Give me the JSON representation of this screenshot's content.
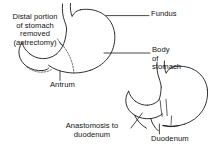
{
  "figure": {
    "background_color": "#ffffff",
    "line_color": "#1a1a1a",
    "text_color": "#111111",
    "width": 223,
    "height": 152
  },
  "labels": {
    "distal_portion": "Distal portion\nof stomach\nremoved\n(antrectomy)",
    "fundus": "Fundus",
    "body_of_stomach": "Body\nof\nstomach",
    "antrum": "Antrum",
    "anastomosis": "Anastomosis to\nduodenum",
    "duodenum": "Duodenum"
  },
  "structures": {
    "upper_figure": {
      "name": "pre-operative stomach with resection margin",
      "parts": [
        "esophagus",
        "fundus",
        "body",
        "antrum",
        "duodenum",
        "resection-line"
      ]
    },
    "lower_figure": {
      "name": "post-operative stomach after antrectomy",
      "parts": [
        "esophagus",
        "fundus",
        "body",
        "anastomosis",
        "duodenum"
      ]
    }
  }
}
